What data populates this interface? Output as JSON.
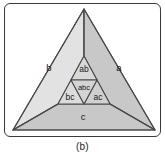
{
  "figure": {
    "caption": "(b)",
    "frame": {
      "border_color": "#3a3a3a",
      "background": "#ffffff"
    }
  },
  "colors": {
    "region_a": "#c8c8c8",
    "region_b": "#e2e2e2",
    "region_c": "#c8c8c8",
    "region_ab": "#d8d8d8",
    "region_ac": "#d0d0d0",
    "region_bc": "#dcdcdc",
    "region_abc": "#d4d4d4",
    "stroke": "#4a4a4a",
    "label_text": "#1a1a1a"
  },
  "diagram": {
    "type": "venn-triangle-partition",
    "regions": [
      {
        "id": "a",
        "label": "a",
        "label_x": 114,
        "label_y": 64
      },
      {
        "id": "b",
        "label": "b",
        "label_x": 44,
        "label_y": 64
      },
      {
        "id": "c",
        "label": "c",
        "label_x": 78,
        "label_y": 113
      },
      {
        "id": "ab",
        "label": "ab",
        "label_x": 79,
        "label_y": 65
      },
      {
        "id": "ac",
        "label": "ac",
        "label_x": 93,
        "label_y": 94
      },
      {
        "id": "bc",
        "label": "bc",
        "label_x": 65,
        "label_y": 94
      },
      {
        "id": "abc",
        "label": "abc",
        "label_x": 79,
        "label_y": 84
      }
    ],
    "geometry": {
      "outer_triangle": "79,5 150,126 8,126",
      "inner_triangle": "79,52 105,100 53,100",
      "inner_midpoints": {
        "left": "66,76",
        "right": "92,76",
        "bottom": "79,100"
      },
      "spoke_apex_to_inner_top": "79,5 79,52",
      "spoke_left_to_inner_left": "8,126 53,100",
      "spoke_right_to_inner_right": "150,126 105,100",
      "region_a_path": "79,5 150,126 105,100 92,76 79,52",
      "region_b_path": "79,5 79,52 66,76 53,100 8,126",
      "region_c_path": "8,126 53,100 79,100 105,100 150,126",
      "region_ab_path": "79,52 92,76 66,76",
      "region_ac_path": "92,76 105,100 79,100",
      "region_bc_path": "66,76 79,100 53,100",
      "region_abc_path": "66,76 92,76 79,100"
    }
  }
}
